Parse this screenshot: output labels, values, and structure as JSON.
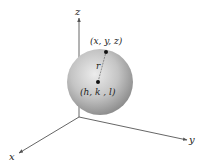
{
  "diagram": {
    "axes": {
      "x_label": "x",
      "y_label": "y",
      "z_label": "z"
    },
    "sphere": {
      "surface_point_label": "(x,  y,  z)",
      "center_label": "(h, k , l)",
      "radius_label": "r"
    },
    "colors": {
      "axis": "#555555",
      "sphere_light": "#e8e8e8",
      "sphere_dark": "#8a8a8a",
      "point": "#111111"
    }
  }
}
